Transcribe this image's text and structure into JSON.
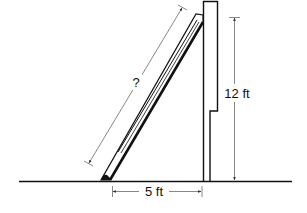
{
  "diagram": {
    "labels": {
      "ladder_length": "?",
      "wall_height": "12 ft",
      "base_distance": "5 ft"
    },
    "colors": {
      "line": "#111111",
      "dimension": "#555555",
      "background": "#ffffff"
    }
  }
}
